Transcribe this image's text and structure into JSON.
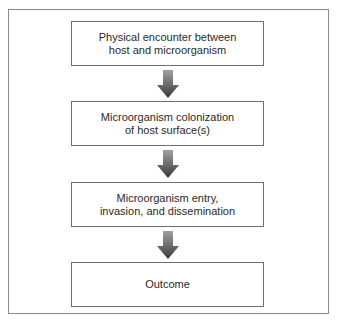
{
  "diagram": {
    "type": "flowchart",
    "direction": "top-to-bottom",
    "steps": [
      {
        "label": "Physical encounter between\nhost and microorganism"
      },
      {
        "label": "Microorganism colonization\nof host surface(s)"
      },
      {
        "label": "Microorganism entry,\ninvasion, and dissemination"
      },
      {
        "label": "Outcome"
      }
    ],
    "connectors": [
      {
        "from": 0,
        "to": 1,
        "icon": "down-arrow-icon"
      },
      {
        "from": 1,
        "to": 2,
        "icon": "down-arrow-icon"
      },
      {
        "from": 2,
        "to": 3,
        "icon": "down-arrow-icon"
      }
    ],
    "colors": {
      "box_border": "#6e6e6e",
      "frame_border": "#8a8a8a",
      "text": "#2a2a2a",
      "arrow_top": "#9a9a9a",
      "arrow_bottom": "#3a3a3a"
    }
  }
}
